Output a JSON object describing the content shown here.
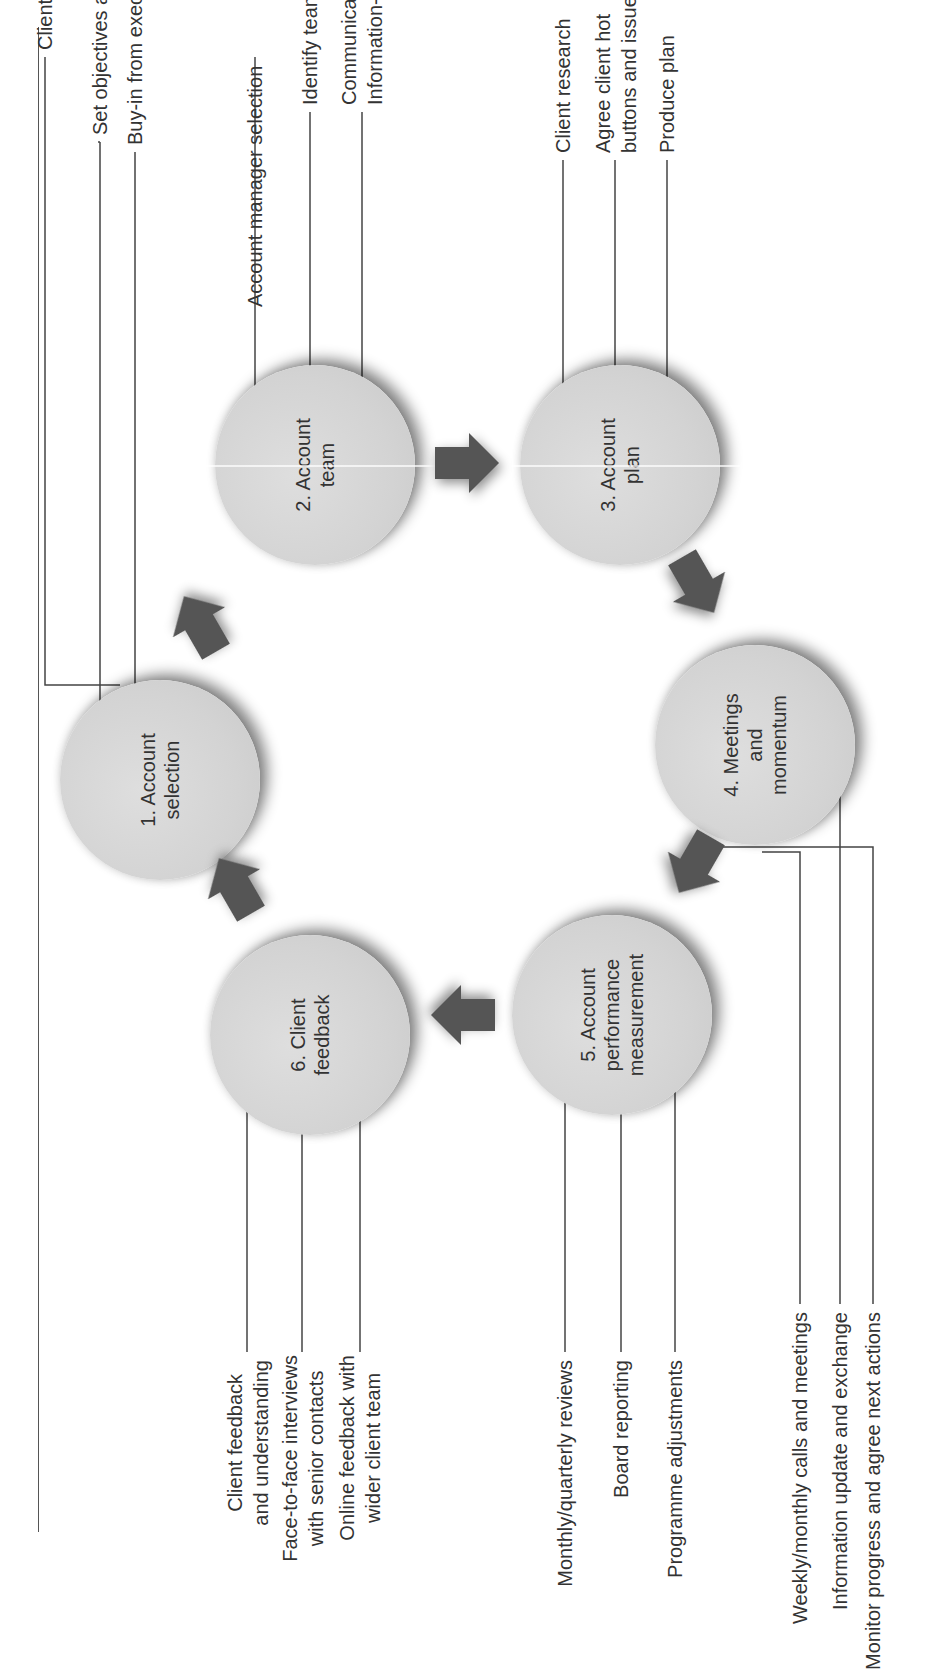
{
  "diagram": {
    "type": "cycle",
    "orientation": "rotated-90-ccw",
    "colors": {
      "circle_fill": "#d3d3d3",
      "arrow_fill": "#555555",
      "text": "#333333",
      "leader_line": "#444444"
    },
    "steps": [
      {
        "number": 1,
        "label_line1": "1. Account",
        "label_line2": "selection",
        "label_line3": "",
        "activities": [
          "Client selection",
          "Set objectives and KPIs",
          "Buy-in from executive"
        ]
      },
      {
        "number": 2,
        "label_line1": "2. Account",
        "label_line2": "team",
        "label_line3": "",
        "activities": [
          "Account manager selection",
          "Identify team",
          "Communication and",
          "Information-sharing"
        ]
      },
      {
        "number": 3,
        "label_line1": "3. Account",
        "label_line2": "plan",
        "label_line3": "",
        "activities": [
          "Client research",
          "Agree client hot",
          "buttons and issues",
          "Produce plan"
        ]
      },
      {
        "number": 4,
        "label_line1": "4. Meetings",
        "label_line2": "and",
        "label_line3": "momentum",
        "activities": [
          "Weekly/monthly calls and meetings",
          "Information update and exchange",
          "Monitor progress and agree next actions"
        ]
      },
      {
        "number": 5,
        "label_line1": "5. Account",
        "label_line2": "performance",
        "label_line3": "measurement",
        "activities": [
          "Monthly/quarterly reviews",
          "Board reporting",
          "Programme adjustments"
        ]
      },
      {
        "number": 6,
        "label_line1": "6. Client",
        "label_line2": "feedback",
        "label_line3": "",
        "activities": [
          "Client feedback",
          "and understanding",
          "Face-to-face interviews",
          "with senior contacts",
          "Online feedback with",
          "wider client team"
        ]
      }
    ],
    "arrows": [
      {
        "from": 1,
        "to": 2,
        "icon": "arrow-right-icon"
      },
      {
        "from": 2,
        "to": 3,
        "icon": "arrow-right-icon"
      },
      {
        "from": 3,
        "to": 4,
        "icon": "arrow-right-icon"
      },
      {
        "from": 4,
        "to": 5,
        "icon": "arrow-right-icon"
      },
      {
        "from": 5,
        "to": 6,
        "icon": "arrow-right-icon"
      },
      {
        "from": 6,
        "to": 1,
        "icon": "arrow-right-icon"
      }
    ]
  }
}
